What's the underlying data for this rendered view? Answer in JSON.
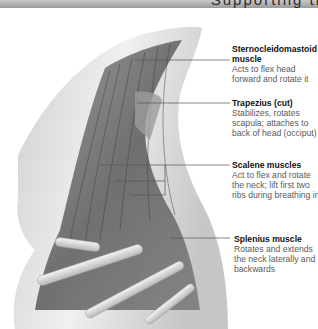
{
  "header": {
    "title": "Supporting th"
  },
  "illustration": {
    "subject": "neck-muscles-anatomy",
    "palette": [
      "#ffffff",
      "#d8d8d8",
      "#9a9a9a",
      "#4a4a4a"
    ]
  },
  "labels": [
    {
      "title": "Sternocleidomastoid muscle",
      "desc": "Acts to flex head forward and rotate it"
    },
    {
      "title": "Trapezius (cut)",
      "desc": "Stabilizes, rotates scapula; attaches to back of head (occiput)"
    },
    {
      "title": "Scalene muscles",
      "desc": "Act to flex and rotate the neck; lift first two ribs during breathing in"
    },
    {
      "title": "Splenius muscle",
      "desc": "Rotates and extends the neck laterally and backwards"
    }
  ]
}
